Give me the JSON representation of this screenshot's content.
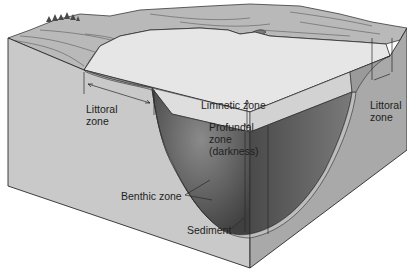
{
  "diagram": {
    "type": "lake-zonation-block-diagram",
    "colors": {
      "land_top": "#b9b9b9",
      "land_dark": "#9c9c9c",
      "water_surface": "#e6e6e6",
      "front_face": "#c9c9c9",
      "right_face": "#a9a9a9",
      "limnetic_band": "#dcdcdc",
      "profundal": "#6f6f6f",
      "sediment": "#bdbdbd",
      "line": "#2a2a2a"
    },
    "labels": {
      "littoral_left": "Littoral\nzone",
      "limnetic": "Limnetic zone",
      "littoral_right": "Littoral\nzone",
      "profundal": "Profundal\nzone\n(darkness)",
      "benthic": "Benthic zone",
      "sediment": "Sediment"
    }
  }
}
